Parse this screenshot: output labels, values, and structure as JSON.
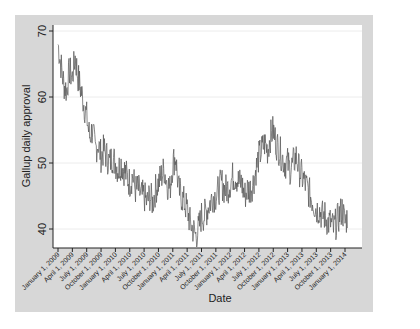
{
  "chart_data": {
    "type": "line",
    "title": "",
    "xlabel": "Date",
    "ylabel": "Gallup daily approval",
    "ylim": [
      38,
      70.5
    ],
    "yticks": [
      40,
      50,
      60,
      70
    ],
    "grid": "horizontal",
    "legend": "none",
    "xticks": [
      "January 1, 2009",
      "April 1, 2009",
      "July 1, 2009",
      "October 1, 2009",
      "January 1, 2010",
      "April 1, 2010",
      "July 1, 2010",
      "October 1, 2010",
      "January 1, 2011",
      "April 1, 2011",
      "July 1, 2011",
      "October 1, 2011",
      "January 1, 2012",
      "April 1, 2012",
      "July 1, 2012",
      "October 1, 2012",
      "January 1, 2013",
      "April 1, 2013",
      "July 1, 2013",
      "October 1, 2013",
      "January 1, 2014"
    ],
    "series": [
      {
        "name": "Gallup daily approval",
        "color": "#555555",
        "x_quarter_index": [
          0,
          0.2,
          0.4,
          0.6,
          0.8,
          1.0,
          1.2,
          1.4,
          1.6,
          1.8,
          2.0,
          2.2,
          2.4,
          2.6,
          2.8,
          3.0,
          3.2,
          3.4,
          3.6,
          3.8,
          4.0,
          4.2,
          4.4,
          4.6,
          4.8,
          5.0,
          5.2,
          5.4,
          5.6,
          5.8,
          6.0,
          6.2,
          6.4,
          6.6,
          6.8,
          7.0,
          7.2,
          7.4,
          7.6,
          7.8,
          8.0,
          8.2,
          8.4,
          8.6,
          8.8,
          9.0,
          9.2,
          9.4,
          9.6,
          9.8,
          10.0,
          10.2,
          10.4,
          10.6,
          10.8,
          11.0,
          11.2,
          11.4,
          11.6,
          11.8,
          12.0,
          12.2,
          12.4,
          12.6,
          12.8,
          13.0,
          13.2,
          13.4,
          13.6,
          13.8,
          14.0,
          14.2,
          14.4,
          14.6,
          14.8,
          15.0,
          15.2,
          15.4,
          15.6,
          15.8,
          16.0,
          16.2,
          16.4,
          16.6,
          16.8,
          17.0,
          17.2,
          17.4,
          17.6,
          17.8,
          18.0,
          18.2,
          18.4,
          18.6,
          18.8,
          19.0,
          19.2,
          19.4,
          19.6,
          19.8,
          20.0,
          20.2
        ],
        "values": [
          68,
          65,
          62,
          61,
          64,
          63,
          66,
          63,
          61,
          59,
          57,
          54,
          55,
          52,
          53,
          51,
          52,
          51,
          50,
          51,
          50,
          49,
          50,
          49,
          48,
          47,
          48,
          46,
          46,
          45,
          45,
          44,
          45,
          44,
          46,
          47,
          48,
          49,
          47,
          46,
          50,
          51,
          46,
          45,
          44,
          43,
          41,
          40,
          39,
          40,
          42,
          42,
          43,
          44,
          45,
          45,
          46,
          47,
          46,
          46,
          47,
          48,
          48,
          47,
          47,
          45,
          46,
          46,
          47,
          49,
          51,
          52,
          53,
          52,
          54,
          55,
          53,
          52,
          51,
          50,
          50,
          49,
          50,
          51,
          49,
          48,
          47,
          46,
          45,
          44,
          43,
          43,
          42,
          42,
          41,
          41,
          40,
          41,
          42,
          43,
          41,
          42
        ]
      }
    ]
  }
}
